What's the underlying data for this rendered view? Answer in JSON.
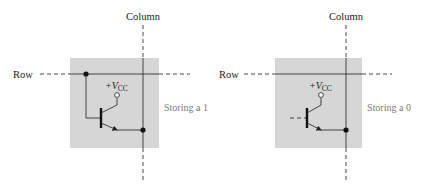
{
  "figure": {
    "colors": {
      "cell_fill": "#d6d6d6",
      "line": "#333333",
      "label": "#222222",
      "state_label": "#7a7a7a"
    },
    "cells": [
      {
        "row_label": "Row",
        "column_label": "Column",
        "supply_label_prefix": "+V",
        "supply_label_sub": "CC",
        "state_label": "Storing a 1",
        "base_connected": true
      },
      {
        "row_label": "Row",
        "column_label": "Column",
        "supply_label_prefix": "+V",
        "supply_label_sub": "CC",
        "state_label": "Storing a 0",
        "base_connected": false
      }
    ]
  }
}
